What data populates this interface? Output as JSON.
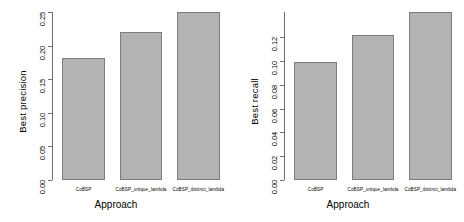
{
  "chart_data": [
    {
      "type": "bar",
      "panel": "left",
      "title": "",
      "xlabel": "Approach",
      "ylabel": "Best precision",
      "categories": [
        "CoBSP",
        "CoBSP_unique_lambda",
        "CoBSP_distinct_lambda"
      ],
      "values": [
        0.181,
        0.2205,
        0.2505
      ],
      "ylim": [
        0.0,
        0.25
      ],
      "yticks": [
        0.0,
        0.05,
        0.1,
        0.15,
        0.2,
        0.25
      ],
      "ytick_labels": [
        "0.00",
        "0.05",
        "0.10",
        "0.15",
        "0.20",
        "0.25"
      ],
      "grid": false,
      "legend": "none",
      "bar_color": "#b3b3b3",
      "bar_border_color": "#7d7d7d",
      "axis_color": "#6e6e6e"
    },
    {
      "type": "bar",
      "panel": "right",
      "title": "",
      "xlabel": "Approach",
      "ylabel": "Best recall",
      "categories": [
        "CoBSP",
        "CoBSP_unique_lambda",
        "CoBSP_distinct_lambda"
      ],
      "values": [
        0.0992,
        0.1222,
        0.1412
      ],
      "ylim": [
        0.0,
        0.1412
      ],
      "yticks": [
        0.0,
        0.02,
        0.04,
        0.06,
        0.08,
        0.1,
        0.12
      ],
      "ytick_labels": [
        "0.00",
        "0.02",
        "0.04",
        "0.06",
        "0.08",
        "0.10",
        "0.12"
      ],
      "grid": false,
      "legend": "none",
      "bar_color": "#b3b3b3",
      "bar_border_color": "#7d7d7d",
      "axis_color": "#6e6e6e"
    }
  ]
}
